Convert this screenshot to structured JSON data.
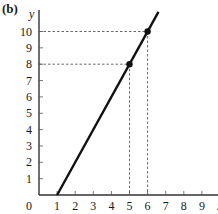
{
  "panel_label": "(b)",
  "chart_data": {
    "type": "line",
    "title": "",
    "xlabel": "x",
    "ylabel": "y",
    "xlim": [
      0,
      10
    ],
    "ylim": [
      0,
      11
    ],
    "x_ticks": [
      1,
      2,
      3,
      4,
      5,
      6,
      7,
      8,
      9
    ],
    "y_ticks": [
      1,
      2,
      3,
      4,
      5,
      6,
      7,
      8,
      9,
      10
    ],
    "origin_label": "0",
    "grid": false,
    "legend": "none",
    "series": [
      {
        "name": "line",
        "description": "y = 2x - 2",
        "x": [
          1,
          6.6
        ],
        "y": [
          0,
          11.2
        ]
      }
    ],
    "points": [
      {
        "x": 5,
        "y": 8
      },
      {
        "x": 6,
        "y": 10
      }
    ],
    "guides": [
      {
        "x": 5,
        "y": 8
      },
      {
        "x": 6,
        "y": 10
      }
    ]
  }
}
